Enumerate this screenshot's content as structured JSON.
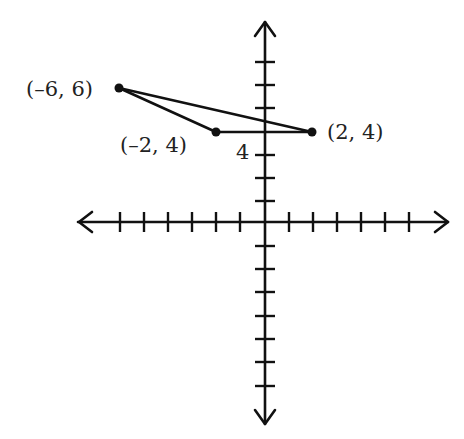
{
  "diagram": {
    "type": "coordinate-plane",
    "x_axis": {
      "ticks_negative": 6,
      "ticks_positive": 6,
      "arrows": true
    },
    "y_axis": {
      "ticks_positive": 6,
      "ticks_negative": 7,
      "arrows": true
    },
    "colors": {
      "stroke": "#111111",
      "background": "#ffffff",
      "text": "#222222"
    },
    "points": [
      {
        "x": -6,
        "y": 6,
        "label": "(–6, 6)"
      },
      {
        "x": -2,
        "y": 4,
        "label": "(–2, 4)"
      },
      {
        "x": 2,
        "y": 4,
        "label": "(2, 4)"
      }
    ],
    "segments": [
      {
        "from": "(-6, 6)",
        "to": "(-2, 4)"
      },
      {
        "from": "(-2, 4)",
        "to": "(2, 4)"
      },
      {
        "from": "(-6, 6)",
        "to": "(2, 4)"
      }
    ],
    "annotation": {
      "text": "4"
    }
  }
}
